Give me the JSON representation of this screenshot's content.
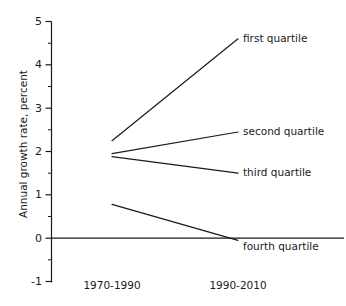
{
  "chart_data": {
    "type": "line",
    "title": "",
    "xlabel": "",
    "ylabel": "Annual growth rate, percent",
    "categories": [
      "1970-1990",
      "1990-2010"
    ],
    "x_tick_labels": [
      "1970-1990",
      "1990-2010"
    ],
    "y_tick_labels": [
      "5",
      "4",
      "3",
      "2",
      "1",
      "0",
      "-1"
    ],
    "y_ticks": [
      5,
      4,
      3,
      2,
      1,
      0,
      -1
    ],
    "y_minor_ticks": [
      4.5,
      3.5,
      2.5,
      1.5,
      0.5,
      -0.5
    ],
    "ylim": [
      -1,
      5
    ],
    "grid": false,
    "legend_position": "right-inline-labels",
    "zero_line": true,
    "series": [
      {
        "name": "first quartile",
        "label": "first quartile",
        "values": [
          2.25,
          4.6
        ]
      },
      {
        "name": "second quartile",
        "label": "second quartile",
        "values": [
          1.95,
          2.45
        ]
      },
      {
        "name": "third quartile",
        "label": "third quartile",
        "values": [
          1.88,
          1.5
        ]
      },
      {
        "name": "fourth quartile",
        "label": "fourth quartile",
        "values": [
          0.78,
          -0.05
        ]
      }
    ]
  },
  "axes": {
    "y_axis_name": "y-axis",
    "x_axis_name": "x-axis"
  },
  "labels": {
    "y_axis_title": "Annual growth rate, percent",
    "ytick_5": "5",
    "ytick_4": "4",
    "ytick_3": "3",
    "ytick_2": "2",
    "ytick_1": "1",
    "ytick_0": "0",
    "ytick_m1": "-1",
    "xtick_1": "1970-1990",
    "xtick_2": "1990-2010",
    "series_first": "first quartile",
    "series_second": "second quartile",
    "series_third": "third quartile",
    "series_fourth": "fourth quartile"
  },
  "colors": {
    "ink": "#1a1a1a",
    "background": "#ffffff"
  }
}
